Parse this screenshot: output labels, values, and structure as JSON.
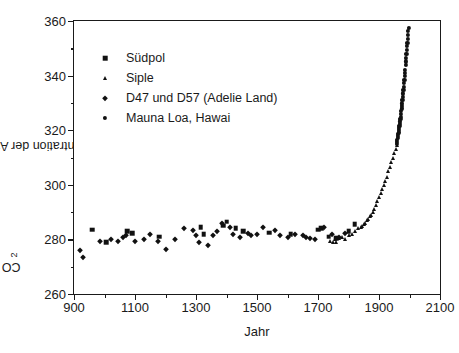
{
  "chart_data": {
    "type": "scatter",
    "title": "",
    "xlabel": "Jahr",
    "ylabel": "CO2 - Konzentration der Atmosphäre (ppm)",
    "ylabel_prefix": "CO",
    "ylabel_subscript": "2",
    "ylabel_suffix": " - Konzentration der Atmosphäre (ppm)",
    "xlim": [
      900,
      2100
    ],
    "ylim": [
      260,
      360
    ],
    "x_ticks": [
      900,
      1100,
      1300,
      1500,
      1700,
      1900,
      2100
    ],
    "x_minor_step": 100,
    "y_ticks": [
      260,
      280,
      300,
      320,
      340,
      360
    ],
    "y_minor_step": 10,
    "grid": false,
    "legend_position": "upper-left-inside",
    "marker_color": "#111111",
    "axis_color": "#1a1a1a",
    "background": "#ffffff",
    "series": [
      {
        "name": "Südpol",
        "marker": "square",
        "points": [
          [
            960,
            283.5
          ],
          [
            1005,
            279.0
          ],
          [
            1075,
            283.0
          ],
          [
            1090,
            282.2
          ],
          [
            1180,
            281.0
          ],
          [
            1315,
            284.5
          ],
          [
            1325,
            282.0
          ],
          [
            1390,
            285.0
          ],
          [
            1400,
            286.5
          ],
          [
            1430,
            284.0
          ],
          [
            1455,
            283.0
          ],
          [
            1540,
            282.5
          ],
          [
            1610,
            282.0
          ],
          [
            1700,
            283.5
          ],
          [
            1710,
            284.0
          ],
          [
            1735,
            281.0
          ],
          [
            1760,
            280.5
          ],
          [
            1800,
            283.0
          ],
          [
            1820,
            285.5
          ]
        ]
      },
      {
        "name": "Siple",
        "marker": "triangle",
        "points": [
          [
            1740,
            279.5
          ],
          [
            1750,
            279.0
          ],
          [
            1755,
            280.0
          ],
          [
            1760,
            279.2
          ],
          [
            1770,
            280.5
          ],
          [
            1780,
            281.0
          ],
          [
            1790,
            280.0
          ],
          [
            1800,
            281.5
          ],
          [
            1810,
            282.0
          ],
          [
            1820,
            283.0
          ],
          [
            1830,
            284.0
          ],
          [
            1840,
            284.5
          ],
          [
            1845,
            285.0
          ],
          [
            1850,
            285.5
          ],
          [
            1855,
            286.0
          ],
          [
            1860,
            287.0
          ],
          [
            1865,
            287.5
          ],
          [
            1870,
            288.5
          ],
          [
            1875,
            289.0
          ],
          [
            1880,
            290.0
          ],
          [
            1885,
            291.0
          ],
          [
            1890,
            292.5
          ],
          [
            1895,
            294.0
          ],
          [
            1900,
            295.5
          ],
          [
            1905,
            297.0
          ],
          [
            1910,
            298.5
          ],
          [
            1915,
            300.0
          ],
          [
            1920,
            301.5
          ],
          [
            1925,
            303.0
          ],
          [
            1930,
            305.0
          ],
          [
            1935,
            306.5
          ],
          [
            1940,
            308.5
          ],
          [
            1945,
            310.0
          ],
          [
            1950,
            311.5
          ],
          [
            1955,
            313.0
          ],
          [
            1958,
            314.5
          ]
        ]
      },
      {
        "name": "D47 und D57 (Adelie Land)",
        "marker": "diamond",
        "points": [
          [
            920,
            276.0
          ],
          [
            930,
            273.5
          ],
          [
            985,
            279.5
          ],
          [
            1020,
            280.0
          ],
          [
            1045,
            279.5
          ],
          [
            1060,
            281.0
          ],
          [
            1070,
            281.5
          ],
          [
            1100,
            279.5
          ],
          [
            1130,
            280.0
          ],
          [
            1150,
            282.0
          ],
          [
            1175,
            279.5
          ],
          [
            1200,
            276.5
          ],
          [
            1230,
            280.0
          ],
          [
            1260,
            284.0
          ],
          [
            1290,
            283.5
          ],
          [
            1300,
            281.5
          ],
          [
            1310,
            279.0
          ],
          [
            1340,
            278.0
          ],
          [
            1355,
            281.5
          ],
          [
            1370,
            283.0
          ],
          [
            1385,
            286.0
          ],
          [
            1410,
            284.5
          ],
          [
            1420,
            282.0
          ],
          [
            1445,
            281.0
          ],
          [
            1470,
            282.5
          ],
          [
            1480,
            281.5
          ],
          [
            1500,
            282.0
          ],
          [
            1520,
            284.5
          ],
          [
            1560,
            283.5
          ],
          [
            1575,
            281.5
          ],
          [
            1600,
            281.0
          ],
          [
            1625,
            282.0
          ],
          [
            1650,
            281.5
          ],
          [
            1660,
            281.0
          ],
          [
            1675,
            280.5
          ],
          [
            1690,
            280.0
          ],
          [
            1720,
            284.5
          ],
          [
            1745,
            282.0
          ],
          [
            1770,
            281.0
          ],
          [
            1790,
            282.5
          ]
        ]
      },
      {
        "name": "Mauna Loa, Hawai",
        "marker": "circle",
        "points": [
          [
            1958,
            315.0
          ],
          [
            1959,
            315.8
          ],
          [
            1960,
            316.5
          ],
          [
            1961,
            317.2
          ],
          [
            1962,
            318.0
          ],
          [
            1963,
            318.6
          ],
          [
            1964,
            319.2
          ],
          [
            1965,
            320.0
          ],
          [
            1966,
            320.8
          ],
          [
            1967,
            321.5
          ],
          [
            1968,
            322.3
          ],
          [
            1969,
            323.2
          ],
          [
            1970,
            324.2
          ],
          [
            1971,
            325.0
          ],
          [
            1972,
            326.0
          ],
          [
            1973,
            327.2
          ],
          [
            1974,
            328.0
          ],
          [
            1975,
            328.8
          ],
          [
            1976,
            329.8
          ],
          [
            1977,
            331.0
          ],
          [
            1978,
            332.2
          ],
          [
            1979,
            333.5
          ],
          [
            1980,
            334.8
          ],
          [
            1981,
            336.0
          ],
          [
            1982,
            337.2
          ],
          [
            1983,
            338.5
          ],
          [
            1984,
            339.8
          ],
          [
            1985,
            341.0
          ],
          [
            1986,
            342.2
          ],
          [
            1987,
            343.8
          ],
          [
            1988,
            345.2
          ],
          [
            1989,
            346.5
          ],
          [
            1990,
            348.0
          ],
          [
            1991,
            349.5
          ],
          [
            1992,
            350.8
          ],
          [
            1993,
            352.0
          ],
          [
            1994,
            353.5
          ],
          [
            1995,
            355.0
          ],
          [
            1996,
            356.5
          ],
          [
            1997,
            357.5
          ]
        ]
      }
    ]
  }
}
